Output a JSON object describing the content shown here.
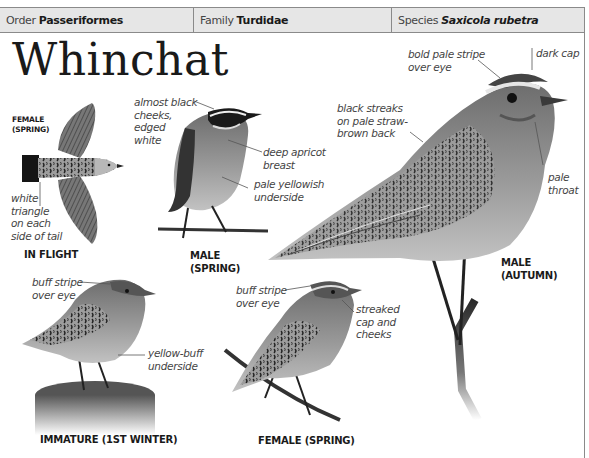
{
  "header": {
    "order_label": "Order",
    "order_value": "Passeriformes",
    "family_label": "Family",
    "family_value": "Turdidae",
    "species_label": "Species",
    "species_value": "Saxicola rubetra"
  },
  "title": "Whinchat",
  "figures": {
    "in_flight": {
      "sublabel": "FEMALE\n(SPRING)",
      "caption": "IN FLIGHT",
      "annotations": [
        "white\ntriangle\non each\nside of tail"
      ]
    },
    "male_spring": {
      "caption": "MALE\n(SPRING)",
      "annotations": [
        "almost black\ncheeks,\nedged\nwhite",
        "deep apricot\nbreast",
        "pale yellowish\nunderside"
      ]
    },
    "male_autumn": {
      "caption": "MALE\n(AUTUMN)",
      "annotations": [
        "bold pale stripe\nover eye",
        "dark cap",
        "black streaks\non pale straw-\nbrown back",
        "pale\nthroat"
      ]
    },
    "immature": {
      "caption": "IMMATURE (1ST WINTER)",
      "annotations": [
        "buff stripe\nover eye",
        "yellow-buff\nunderside"
      ]
    },
    "female_spring": {
      "caption": "FEMALE (SPRING)",
      "annotations": [
        "buff stripe\nover eye",
        "streaked\ncap and\ncheeks"
      ]
    }
  },
  "colors": {
    "header_bg": "#e6e6e6",
    "border": "#8a8a8a",
    "text": "#1a1a1a",
    "annotation": "#444444"
  }
}
